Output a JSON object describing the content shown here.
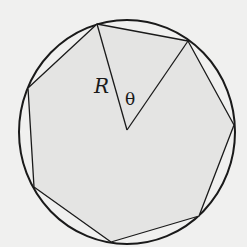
{
  "diagram": {
    "labels": {
      "radius": "R",
      "angle": "θ"
    },
    "colors": {
      "background": "#f0f0ef",
      "polygon_fill": "#e4e4e3",
      "stroke": "#1a1a1a"
    },
    "circle": {
      "cx": 127,
      "cy": 132,
      "rx": 108,
      "ry": 112
    },
    "center": {
      "x": 127,
      "y": 130
    },
    "polygon_vertices": [
      [
        97,
        24
      ],
      [
        188,
        41
      ],
      [
        234,
        125
      ],
      [
        199,
        216
      ],
      [
        111,
        242
      ],
      [
        34,
        187
      ],
      [
        28,
        88
      ]
    ],
    "sector": {
      "from_vertex": 0,
      "to_vertex": 1
    }
  }
}
